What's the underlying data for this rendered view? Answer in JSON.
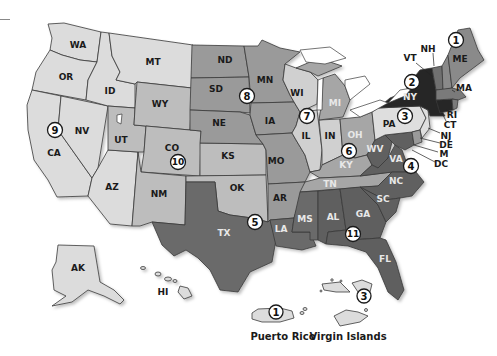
{
  "map": {
    "title": "U.S. Federal Judicial Circuits",
    "shades": {
      "very_light": "#dedede",
      "light": "#c9c9c9",
      "medium_light": "#b4b4b4",
      "medium": "#9a9a9a",
      "medium_dark": "#858585",
      "dark": "#666666",
      "darker": "#555555",
      "very_dark": "#262626"
    },
    "states": [
      {
        "abbr": "WA",
        "region": 9
      },
      {
        "abbr": "OR",
        "region": 9
      },
      {
        "abbr": "CA",
        "region": 9
      },
      {
        "abbr": "NV",
        "region": 9
      },
      {
        "abbr": "ID",
        "region": 9
      },
      {
        "abbr": "MT",
        "region": 9
      },
      {
        "abbr": "AZ",
        "region": 9
      },
      {
        "abbr": "AK",
        "region": 9
      },
      {
        "abbr": "HI",
        "region": 9
      },
      {
        "abbr": "UT",
        "region": 10
      },
      {
        "abbr": "WY",
        "region": 10
      },
      {
        "abbr": "CO",
        "region": 10
      },
      {
        "abbr": "NM",
        "region": 10
      },
      {
        "abbr": "KS",
        "region": 10
      },
      {
        "abbr": "OK",
        "region": 10
      },
      {
        "abbr": "ND",
        "region": 8
      },
      {
        "abbr": "SD",
        "region": 8
      },
      {
        "abbr": "NE",
        "region": 8
      },
      {
        "abbr": "MN",
        "region": 8
      },
      {
        "abbr": "IA",
        "region": 8
      },
      {
        "abbr": "MO",
        "region": 8
      },
      {
        "abbr": "AR",
        "region": 8
      },
      {
        "abbr": "WI",
        "region": 7
      },
      {
        "abbr": "IL",
        "region": 7
      },
      {
        "abbr": "IN",
        "region": 7
      },
      {
        "abbr": "MI",
        "region": 6
      },
      {
        "abbr": "OH",
        "region": 6
      },
      {
        "abbr": "KY",
        "region": 6
      },
      {
        "abbr": "TN",
        "region": 6
      },
      {
        "abbr": "TX",
        "region": 5
      },
      {
        "abbr": "LA",
        "region": 5
      },
      {
        "abbr": "MS",
        "region": 5
      },
      {
        "abbr": "WV",
        "region": 4
      },
      {
        "abbr": "VA",
        "region": 4
      },
      {
        "abbr": "NC",
        "region": 4
      },
      {
        "abbr": "SC",
        "region": 4
      },
      {
        "abbr": "M",
        "region": 4
      },
      {
        "abbr": "PA",
        "region": 3
      },
      {
        "abbr": "NJ",
        "region": 3
      },
      {
        "abbr": "DE",
        "region": 3
      },
      {
        "abbr": "NY",
        "region": 2
      },
      {
        "abbr": "VT",
        "region": 2
      },
      {
        "abbr": "CT",
        "region": 2
      },
      {
        "abbr": "ME",
        "region": 1
      },
      {
        "abbr": "NH",
        "region": 1
      },
      {
        "abbr": "MA",
        "region": 1
      },
      {
        "abbr": "RI",
        "region": 1
      },
      {
        "abbr": "AL",
        "region": 11
      },
      {
        "abbr": "GA",
        "region": 11
      },
      {
        "abbr": "FL",
        "region": 11
      },
      {
        "abbr": "DC",
        "region": "DC"
      }
    ],
    "labels": {
      "WA": "WA",
      "OR": "OR",
      "CA": "CA",
      "NV": "NV",
      "ID": "ID",
      "MT": "MT",
      "AZ": "AZ",
      "AK": "AK",
      "HI": "HI",
      "UT": "UT",
      "WY": "WY",
      "CO": "CO",
      "NM": "NM",
      "KS": "KS",
      "OK": "OK",
      "ND": "ND",
      "SD": "SD",
      "NE": "NE",
      "MN": "MN",
      "IA": "IA",
      "MO": "MO",
      "AR": "AR",
      "WI": "WI",
      "IL": "IL",
      "IN": "IN",
      "MI": "MI",
      "OH": "OH",
      "KY": "KY",
      "TN": "TN",
      "TX": "TX",
      "LA": "LA",
      "MS": "MS",
      "WV": "WV",
      "VA": "VA",
      "NC": "NC",
      "SC": "SC",
      "M": "M",
      "DC": "DC",
      "PA": "PA",
      "NJ": "NJ",
      "DE": "DE",
      "NY": "NY",
      "VT": "VT",
      "CT": "CT",
      "ME": "ME",
      "NH": "NH",
      "MA": "MA",
      "RI": "RI",
      "AL": "AL",
      "GA": "GA",
      "FL": "FL"
    },
    "region_badges": {
      "r1": "1",
      "r2": "2",
      "r3": "3",
      "r4": "4",
      "r5": "5",
      "r6": "6",
      "r7": "7",
      "r8": "8",
      "r9": "9",
      "r10": "10",
      "r11": "11",
      "r1_pr": "1",
      "r3_vi": "3"
    },
    "territories": {
      "puerto_rico": "Puerto Rico",
      "virgin_islands": "Virgin Islands"
    }
  }
}
